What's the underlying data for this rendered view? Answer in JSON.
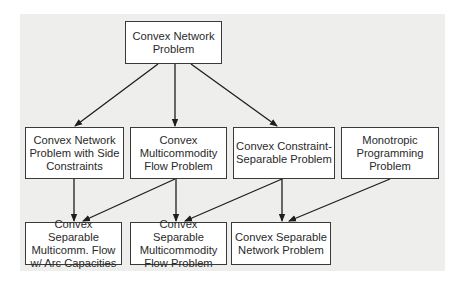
{
  "diagram": {
    "nodes": [
      {
        "id": "n0",
        "label": "Convex Network\nProblem"
      },
      {
        "id": "n1",
        "label": "Convex Network\nProblem with Side\nConstraints"
      },
      {
        "id": "n2",
        "label": "Convex\nMulticommodity\nFlow Problem"
      },
      {
        "id": "n3",
        "label": "Convex Constraint-\nSeparable Problem"
      },
      {
        "id": "n4",
        "label": "Monotropic\nProgramming\nProblem"
      },
      {
        "id": "n5",
        "label": "Convex Separable\nMulticomm. Flow\nw/  Arc Capacities"
      },
      {
        "id": "n6",
        "label": "Convex Separable\nMulticommodity\nFlow Problem"
      },
      {
        "id": "n7",
        "label": "Convex Separable\nNetwork Problem"
      }
    ],
    "edges": [
      {
        "from": "n0",
        "to": "n1"
      },
      {
        "from": "n0",
        "to": "n2"
      },
      {
        "from": "n0",
        "to": "n3"
      },
      {
        "from": "n1",
        "to": "n5"
      },
      {
        "from": "n2",
        "to": "n5"
      },
      {
        "from": "n2",
        "to": "n6"
      },
      {
        "from": "n3",
        "to": "n6"
      },
      {
        "from": "n3",
        "to": "n7"
      },
      {
        "from": "n4",
        "to": "n7"
      }
    ],
    "colors": {
      "background": "#eeeeec",
      "box_border": "#3a3a3a",
      "arrow": "#1e1e1e",
      "text": "#2a2a2a"
    }
  }
}
